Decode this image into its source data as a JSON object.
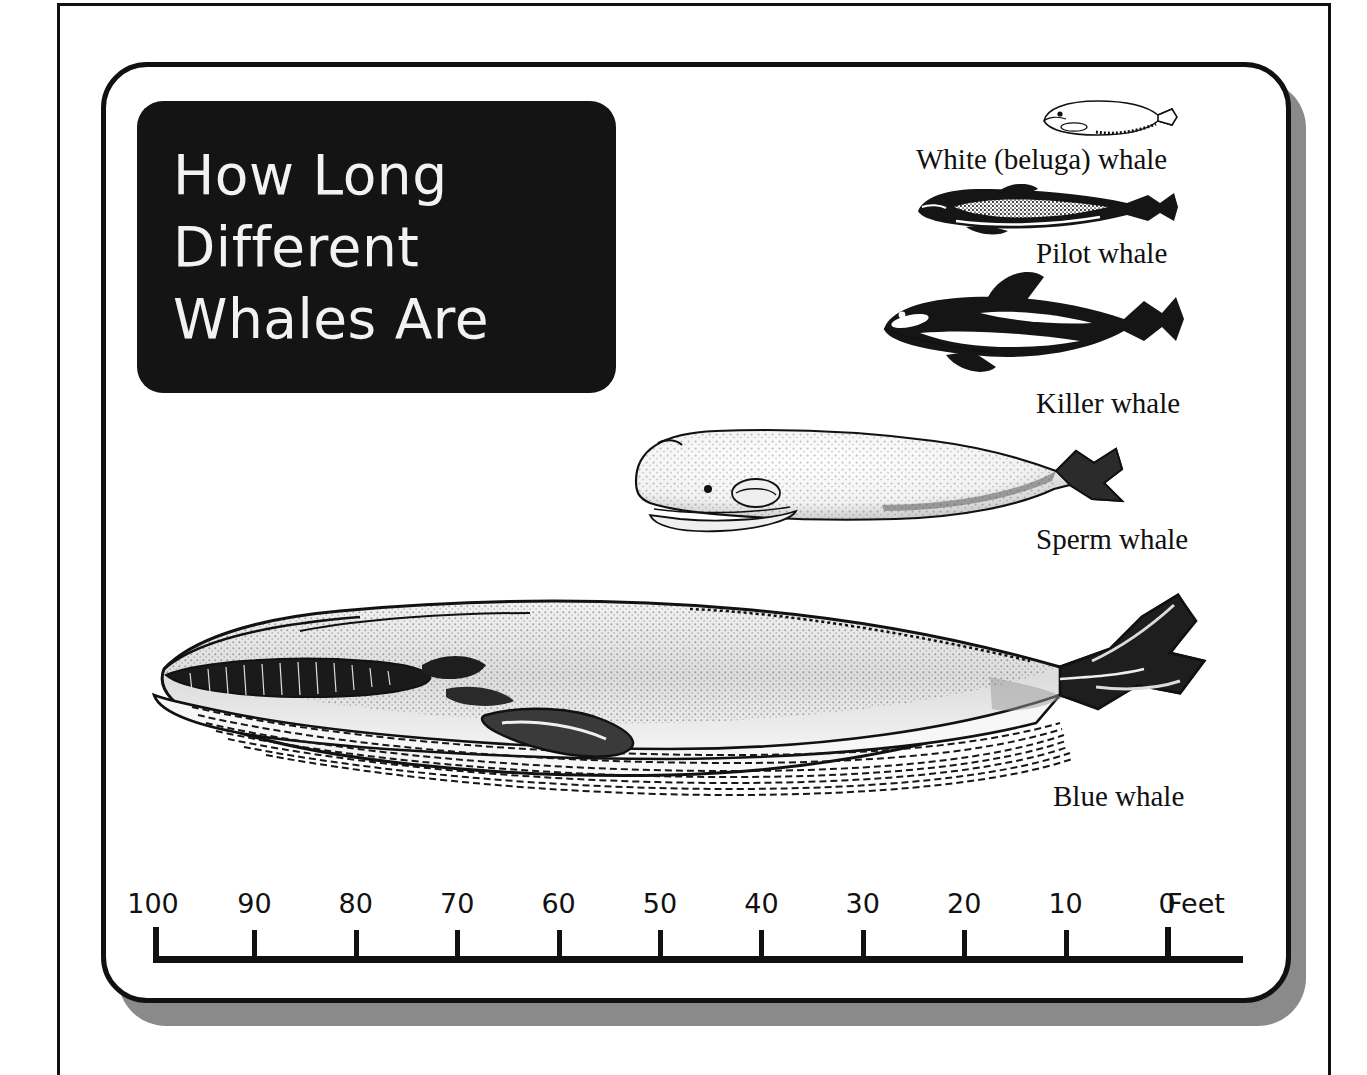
{
  "poster": {
    "title_lines": [
      "How Long",
      "Different",
      "Whales Are"
    ],
    "title_text": "How Long Different Whales Are",
    "background_color": "#ffffff",
    "title_plate_color": "#141414",
    "title_text_color": "#f2f2f2",
    "ink_color": "#111111",
    "shadow_color": "#8a8a8a"
  },
  "whales": [
    {
      "id": "beluga",
      "label": "White (beluga) whale",
      "icon": "beluga-whale-icon",
      "approx_length_feet": 15
    },
    {
      "id": "pilot",
      "label": "Pilot whale",
      "icon": "pilot-whale-icon",
      "approx_length_feet": 25
    },
    {
      "id": "killer",
      "label": "Killer whale",
      "icon": "killer-whale-icon",
      "approx_length_feet": 30
    },
    {
      "id": "sperm",
      "label": "Sperm whale",
      "icon": "sperm-whale-icon",
      "approx_length_feet": 55
    },
    {
      "id": "blue",
      "label": "Blue whale",
      "icon": "blue-whale-icon",
      "approx_length_feet": 100
    }
  ],
  "scale": {
    "unit_label": "Feet",
    "ticks": [
      "100",
      "90",
      "80",
      "70",
      "60",
      "50",
      "40",
      "30",
      "20",
      "10",
      "0"
    ],
    "min": 0,
    "max": 100,
    "step": 10,
    "direction": "right-to-left"
  },
  "chart_data": {
    "type": "bar",
    "title": "How Long Different Whales Are",
    "xlabel": "Feet",
    "ylabel": "",
    "categories": [
      "White (beluga) whale",
      "Pilot whale",
      "Killer whale",
      "Sperm whale",
      "Blue whale"
    ],
    "values": [
      15,
      25,
      30,
      55,
      100
    ],
    "xlim": [
      0,
      100
    ],
    "tick_labels": [
      "100",
      "90",
      "80",
      "70",
      "60",
      "50",
      "40",
      "30",
      "20",
      "10",
      "0"
    ],
    "grid": false,
    "legend": "none",
    "orientation": "horizontal",
    "note": "Scale bar runs 100 feet at left to 0 feet at right; each whale silhouette is drawn to scale and right-aligned at 0 feet."
  }
}
